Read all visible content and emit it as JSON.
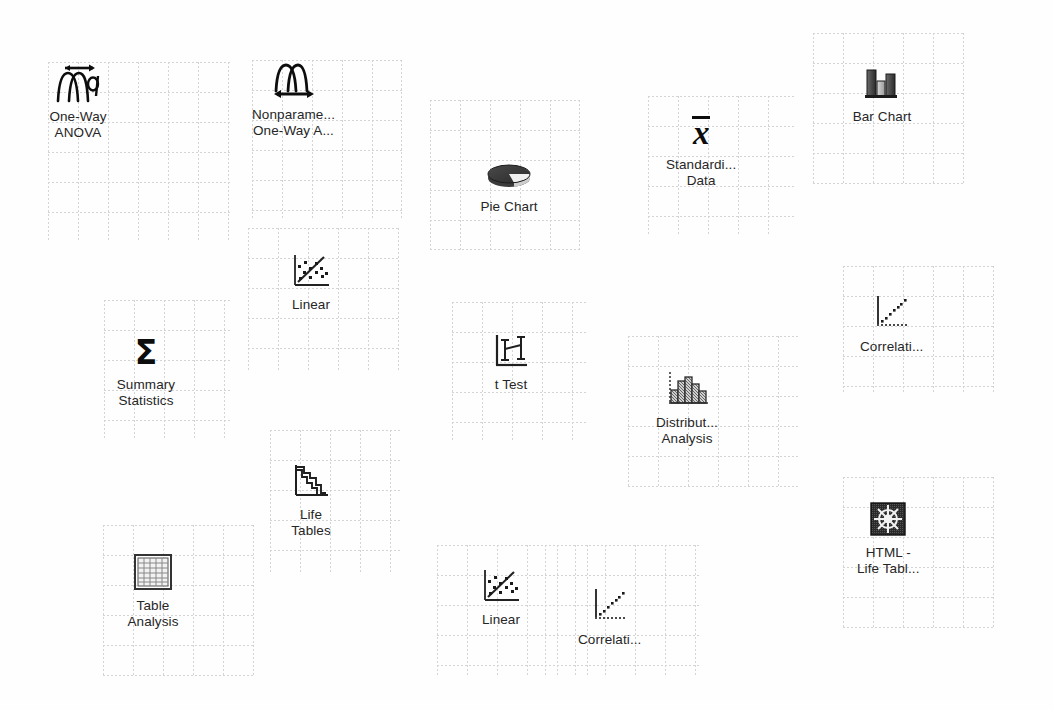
{
  "window": {
    "background_color": "#fefefe",
    "grid_line_color": "#d4d4d4",
    "icon_color": "#0d0d0d",
    "label_color": "#262626",
    "width": 1053,
    "height": 710
  },
  "icons": [
    {
      "id": "one-way-anova",
      "name": "one-way-anova",
      "icon": "anova-curves-arrow-alpha-icon",
      "label_line1": "One-Way",
      "label_line2": "ANOVA",
      "x": 48,
      "y": 62,
      "patch": {
        "x": 48,
        "y": 62,
        "w": 182,
        "h": 178
      }
    },
    {
      "id": "nonparametric-one-way-anova",
      "name": "nonparametric-one-way-anova",
      "icon": "nonparametric-curves-arrow-icon",
      "label_line1": "Nonparame...",
      "label_line2": "One-Way A...",
      "x": 252,
      "y": 60,
      "patch": {
        "x": 252,
        "y": 60,
        "w": 150,
        "h": 158
      }
    },
    {
      "id": "linear-upper",
      "name": "linear-fit",
      "icon": "scatter-regression-line-icon",
      "label_line1": "Linear",
      "label_line2": "",
      "x": 281,
      "y": 250,
      "patch": {
        "x": 248,
        "y": 228,
        "w": 152,
        "h": 142
      }
    },
    {
      "id": "summary-statistics",
      "name": "summary-statistics",
      "icon": "sigma-icon",
      "label_line1": "Summary",
      "label_line2": "Statistics",
      "x": 116,
      "y": 330,
      "patch": {
        "x": 104,
        "y": 300,
        "w": 126,
        "h": 138
      }
    },
    {
      "id": "life-tables",
      "name": "life-tables",
      "icon": "survival-step-curve-icon",
      "label_line1": "Life",
      "label_line2": "Tables",
      "x": 281,
      "y": 460,
      "patch": {
        "x": 270,
        "y": 430,
        "w": 132,
        "h": 144
      }
    },
    {
      "id": "table-analysis",
      "name": "table-analysis",
      "icon": "grid-table-icon",
      "label_line1": "Table",
      "label_line2": "Analysis",
      "x": 123,
      "y": 551,
      "patch": {
        "x": 103,
        "y": 525,
        "w": 152,
        "h": 152
      }
    },
    {
      "id": "pie-chart",
      "name": "pie-chart",
      "icon": "pie-3d-icon",
      "label_line1": "Pie Chart",
      "label_line2": "",
      "x": 479,
      "y": 152,
      "patch": {
        "x": 430,
        "y": 100,
        "w": 150,
        "h": 150
      }
    },
    {
      "id": "t-test",
      "name": "t-test",
      "icon": "error-bars-axes-icon",
      "label_line1": "t Test",
      "label_line2": "",
      "x": 481,
      "y": 330,
      "patch": {
        "x": 452,
        "y": 302,
        "w": 136,
        "h": 140
      }
    },
    {
      "id": "linear-lower",
      "name": "linear-fit",
      "icon": "scatter-regression-line-icon",
      "label_line1": "Linear",
      "label_line2": "",
      "x": 471,
      "y": 565,
      "patch": {
        "x": 437,
        "y": 545,
        "w": 152,
        "h": 130
      }
    },
    {
      "id": "correlations-lower",
      "name": "correlations",
      "icon": "correlation-dotted-line-icon",
      "label_line1": "Correlati...",
      "label_line2": "",
      "x": 578,
      "y": 585,
      "patch": {
        "x": 545,
        "y": 545,
        "w": 155,
        "h": 130
      }
    },
    {
      "id": "standardize-data",
      "name": "standardize-data",
      "icon": "x-bar-icon",
      "label_line1": "Standardi...",
      "label_line2": "Data",
      "x": 666,
      "y": 110,
      "patch": {
        "x": 648,
        "y": 96,
        "w": 148,
        "h": 140
      }
    },
    {
      "id": "distribution-analysis",
      "name": "distribution-analysis",
      "icon": "histogram-icon",
      "label_line1": "Distribut...",
      "label_line2": "Analysis",
      "x": 656,
      "y": 368,
      "patch": {
        "x": 628,
        "y": 336,
        "w": 172,
        "h": 152
      }
    },
    {
      "id": "bar-chart",
      "name": "bar-chart",
      "icon": "bar-chart-icon",
      "label_line1": "Bar Chart",
      "label_line2": "",
      "x": 852,
      "y": 62,
      "patch": {
        "x": 813,
        "y": 33,
        "w": 152,
        "h": 152
      }
    },
    {
      "id": "correlations-upper",
      "name": "correlations",
      "icon": "correlation-dotted-line-icon",
      "label_line1": "Correlati...",
      "label_line2": "",
      "x": 860,
      "y": 292,
      "patch": {
        "x": 843,
        "y": 266,
        "w": 152,
        "h": 126
      }
    },
    {
      "id": "html-life-tables",
      "name": "html-life-tables",
      "icon": "ships-wheel-dark-square-icon",
      "label_line1": "HTML -",
      "label_line2": "Life Tabl...",
      "x": 857,
      "y": 498,
      "patch": {
        "x": 843,
        "y": 477,
        "w": 152,
        "h": 152
      }
    }
  ]
}
